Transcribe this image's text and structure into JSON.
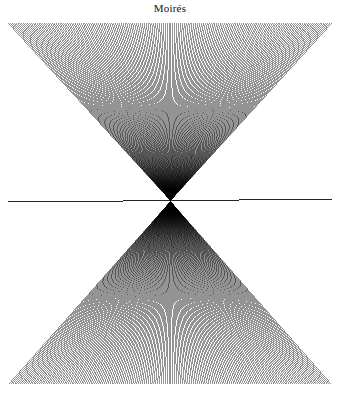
{
  "figure": {
    "title": "Moirés",
    "kind": "moire-line-pattern",
    "background_color": "#ffffff",
    "ink_color": "#000000",
    "canvas": {
      "width": 340,
      "height": 397
    }
  },
  "chart_data": {
    "type": "line",
    "title": "Moirés",
    "subtitle": "",
    "xlabel": "",
    "ylabel": "",
    "grid": false,
    "legend": "none",
    "plate": {
      "x0": 8,
      "y0": 23,
      "x1": 332,
      "y1": 384
    },
    "focus": {
      "x": 170.5,
      "y": 200.5
    },
    "xlim": [
      8,
      332
    ],
    "ylim": [
      23,
      384
    ],
    "series": [
      {
        "name": "rays-from-top-edge",
        "count": 170,
        "edge": "top",
        "edge_y": 23,
        "edge_x_start": 8,
        "edge_x_end": 332,
        "converges_to": [
          170.5,
          200.5
        ],
        "overshoot": 1.0,
        "stroke_width": 0.42
      },
      {
        "name": "rays-from-bottom-edge",
        "count": 170,
        "edge": "bottom",
        "edge_y": 384,
        "edge_x_start": 8,
        "edge_x_end": 332,
        "converges_to": [
          170.5,
          200.5
        ],
        "overshoot": 1.0,
        "stroke_width": 0.42
      },
      {
        "name": "horizontal-axis-line",
        "count": 1,
        "x": [
          8,
          332
        ],
        "y": [
          202.0,
          199.2
        ],
        "stroke_width": 0.85
      }
    ],
    "fringe_centers": [
      {
        "x": 170.5,
        "y": 163
      },
      {
        "x": 170.5,
        "y": 238
      }
    ]
  }
}
